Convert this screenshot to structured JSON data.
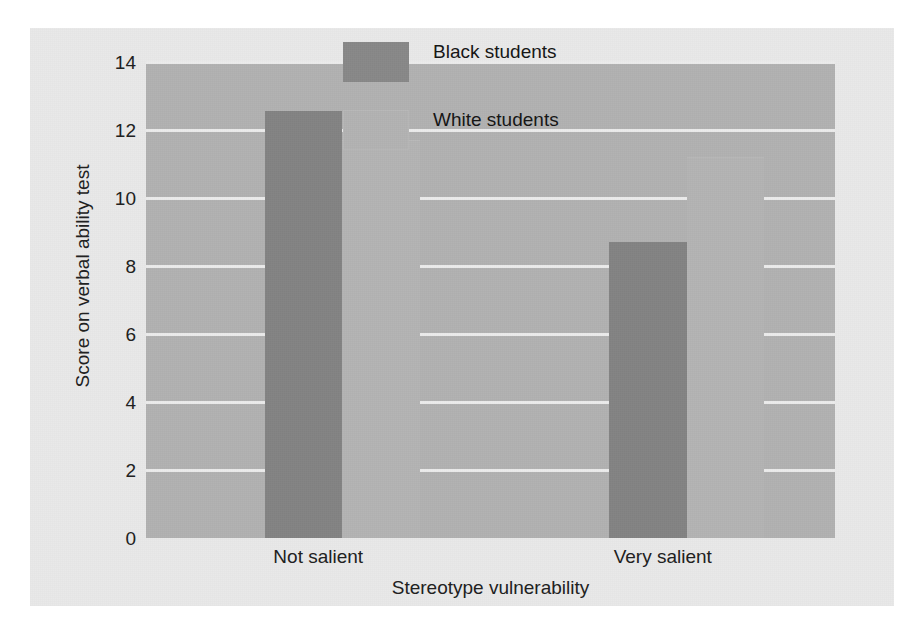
{
  "chart_data": {
    "type": "bar",
    "title": "",
    "subtitle": "",
    "xlabel": "Stereotype vulnerability",
    "ylabel": "Score on verbal ability test",
    "categories": [
      "Not salient",
      "Very salient"
    ],
    "series": [
      {
        "name": "Black students",
        "values": [
          12.55,
          8.7
        ],
        "color": "#838383"
      },
      {
        "name": "White students",
        "values": [
          11.7,
          11.2
        ],
        "color": "#b4b4b4"
      }
    ],
    "ylim": [
      0,
      14
    ],
    "ytick_values": [
      0,
      2,
      4,
      6,
      8,
      10,
      12,
      14
    ],
    "ytick_labels": [
      "0",
      "2",
      "4",
      "6",
      "8",
      "10",
      "12",
      "14"
    ],
    "grid": true,
    "grid_color": "#ececec",
    "grid_axis": "y",
    "legend_position": "upper center",
    "plot_background": "#b2b2b2",
    "figure_background": "#e9e9e9"
  },
  "legend": {
    "items": [
      {
        "label": "Black students",
        "swatch": "dark"
      },
      {
        "label": "White students",
        "swatch": "light"
      }
    ]
  }
}
